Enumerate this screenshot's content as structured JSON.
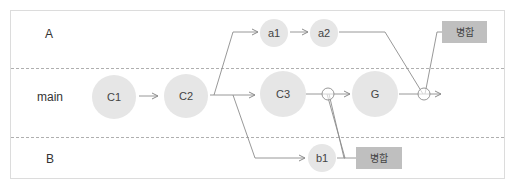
{
  "diagram": {
    "type": "git-branch-flow",
    "colors": {
      "border": "#dcdcdc",
      "lane_divider": "#9a9a9a",
      "node_fill": "#e6e6e6",
      "line": "#8c8c8c",
      "tag_fill": "#bfbfbf",
      "text": "#444444"
    },
    "lanes": [
      {
        "id": "A",
        "label": "A"
      },
      {
        "id": "main",
        "label": "main"
      },
      {
        "id": "B",
        "label": "B"
      }
    ],
    "nodes": {
      "c1": {
        "label": "C1",
        "lane": "main"
      },
      "c2": {
        "label": "C2",
        "lane": "main"
      },
      "c3": {
        "label": "C3",
        "lane": "main"
      },
      "g": {
        "label": "G",
        "lane": "main"
      },
      "a1": {
        "label": "a1",
        "lane": "A"
      },
      "a2": {
        "label": "a2",
        "lane": "A"
      },
      "b1": {
        "label": "b1",
        "lane": "B"
      }
    },
    "tags": {
      "merge_top": {
        "label": "병합"
      },
      "merge_bottom": {
        "label": "병합"
      }
    },
    "edges": [
      {
        "from": "C1",
        "to": "C2"
      },
      {
        "from": "C2",
        "to": "C3"
      },
      {
        "from": "C2",
        "to": "a1"
      },
      {
        "from": "a1",
        "to": "a2"
      },
      {
        "from": "C2",
        "to": "b1"
      },
      {
        "from": "C3",
        "to": "G",
        "via": "merge point (b1 merged)"
      },
      {
        "from": "b1",
        "to": "main merge point"
      },
      {
        "from": "G",
        "to": "next",
        "via": "merge point (a2 merged)"
      },
      {
        "from": "a2",
        "to": "main merge point"
      }
    ]
  }
}
